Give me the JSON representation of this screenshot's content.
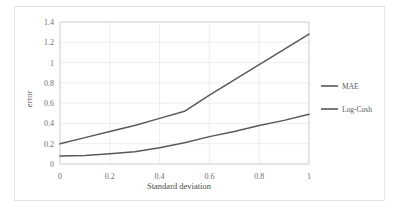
{
  "chart_data": {
    "type": "line",
    "title": "",
    "xlabel": "Standard deviation",
    "ylabel": "error",
    "xlim": [
      0,
      1
    ],
    "ylim": [
      0,
      1.4
    ],
    "xticks": [
      "0",
      "0.2",
      "0.4",
      "0.6",
      "0.8",
      "1"
    ],
    "yticks": [
      "0",
      "0.2",
      "0.4",
      "0.6",
      "0.8",
      "1",
      "1.2",
      "1.4"
    ],
    "grid": true,
    "legend_position": "right",
    "x": [
      0,
      0.1,
      0.2,
      0.3,
      0.4,
      0.5,
      0.6,
      0.7,
      0.8,
      0.9,
      1.0
    ],
    "series": [
      {
        "name": "MAE",
        "color": "#595959",
        "values": [
          0.2,
          0.26,
          0.32,
          0.38,
          0.45,
          0.52,
          0.68,
          0.83,
          0.98,
          1.13,
          1.28
        ]
      },
      {
        "name": "Log-Cosh",
        "color": "#595959",
        "values": [
          0.08,
          0.085,
          0.1,
          0.12,
          0.16,
          0.21,
          0.27,
          0.32,
          0.38,
          0.43,
          0.49
        ]
      }
    ]
  },
  "legend": {
    "entries": [
      {
        "label": "MAE"
      },
      {
        "label": "Log-Cosh"
      }
    ]
  },
  "axes": {
    "x_title": "Standard deviation",
    "y_title": "error"
  },
  "colors": {
    "series_line": "#595959",
    "gridline": "#e8e8e8",
    "axis": "#d0d0d0",
    "tick_label": "#6e6e6e",
    "axis_title": "#4a4a4a",
    "figure_border": "#e3e3e3",
    "background": "#ffffff"
  }
}
